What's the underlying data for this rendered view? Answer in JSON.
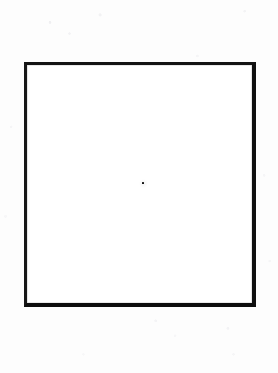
{
  "figure": {
    "title": "",
    "caption": "",
    "medium": "scanned line drawing"
  },
  "canvas": {
    "width_px": 278,
    "height_px": 373,
    "background_color": "#fdfdfd",
    "paper_color": "#ffffff"
  },
  "shapes": {
    "square": {
      "name": "square outline",
      "stroke_color": "#121212",
      "fill_color": "#ffffff",
      "stroke_width_px": 3,
      "left_px": 24,
      "top_px": 62,
      "width_px": 232,
      "height_px": 245,
      "right_px": 256,
      "bottom_px": 307
    },
    "center_dot": {
      "name": "centre dot",
      "color": "#111111",
      "diameter_px": 2.4,
      "center_x_px": 143,
      "center_y_px": 183
    }
  },
  "labels": {
    "text_items": []
  }
}
